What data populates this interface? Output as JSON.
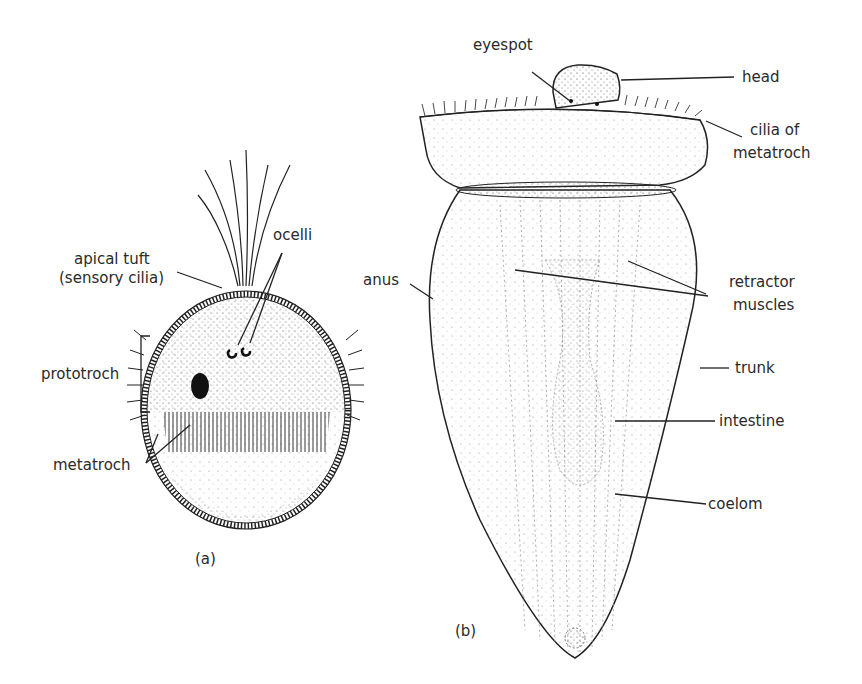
{
  "figure": {
    "panel_a": {
      "caption": "(a)",
      "labels": {
        "apical_tuft_line1": "apical tuft",
        "apical_tuft_line2": "(sensory cilia)",
        "ocelli": "ocelli",
        "prototroch": "prototroch",
        "metatroch": "metatroch"
      }
    },
    "panel_b": {
      "caption": "(b)",
      "labels": {
        "eyespot": "eyespot",
        "head": "head",
        "cilia_of_metatroch_line1": "cilia of",
        "cilia_of_metatroch_line2": "metatroch",
        "anus": "anus",
        "retractor_muscles_line1": "retractor",
        "retractor_muscles_line2": "muscles",
        "trunk": "trunk",
        "intestine": "intestine",
        "coelom": "coelom"
      }
    }
  }
}
